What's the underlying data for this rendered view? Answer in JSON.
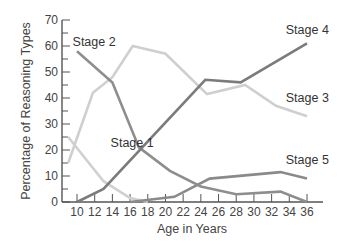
{
  "chart_data": {
    "type": "line",
    "title": "",
    "xlabel": "Age in Years",
    "ylabel": "Percentage of Reasoning Types",
    "xlim": [
      9,
      37
    ],
    "ylim": [
      0,
      70
    ],
    "x_ticks": [
      10,
      12,
      14,
      16,
      18,
      20,
      22,
      24,
      26,
      28,
      30,
      32,
      34,
      36
    ],
    "y_ticks": [
      0,
      10,
      20,
      30,
      40,
      50,
      60,
      70
    ],
    "y_minor_step": 5,
    "grid": false,
    "legend": "inline labels",
    "series": [
      {
        "name": "Stage 1",
        "color": "#d0d0d0",
        "label_pos": {
          "x": 13.8,
          "y": 21
        },
        "points": [
          [
            9,
            25
          ],
          [
            13,
            8
          ],
          [
            16,
            1.5
          ],
          [
            18,
            0
          ]
        ]
      },
      {
        "name": "Stage 2",
        "color": "#8e8e8e",
        "label_pos": {
          "x": 9.5,
          "y": 60
        },
        "points": [
          [
            10,
            58
          ],
          [
            14,
            46
          ],
          [
            17,
            21
          ],
          [
            20.5,
            12
          ],
          [
            24,
            6
          ],
          [
            28,
            3
          ],
          [
            33,
            4
          ],
          [
            36,
            0
          ]
        ]
      },
      {
        "name": "Stage 3",
        "color": "#cfcfcf",
        "label_pos": {
          "x": 33.6,
          "y": 38.5
        },
        "points": [
          [
            9,
            15
          ],
          [
            11.8,
            42
          ],
          [
            14,
            48
          ],
          [
            16.3,
            60
          ],
          [
            20,
            57
          ],
          [
            24.7,
            41.5
          ],
          [
            29,
            45
          ],
          [
            32.5,
            37
          ],
          [
            36,
            33
          ]
        ]
      },
      {
        "name": "Stage 4",
        "color": "#7b7b7b",
        "label_pos": {
          "x": 33.6,
          "y": 64.5
        },
        "points": [
          [
            10,
            0
          ],
          [
            13,
            5
          ],
          [
            24.5,
            47
          ],
          [
            28.5,
            46
          ],
          [
            36,
            61
          ]
        ]
      },
      {
        "name": "Stage 5",
        "color": "#8a8a8a",
        "label_pos": {
          "x": 33.6,
          "y": 14.5
        },
        "points": [
          [
            16,
            0
          ],
          [
            21,
            2
          ],
          [
            25,
            9
          ],
          [
            33,
            11.5
          ],
          [
            36,
            9
          ]
        ]
      }
    ]
  }
}
